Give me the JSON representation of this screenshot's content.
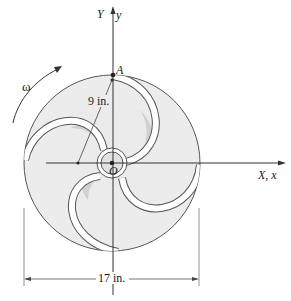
{
  "figure": {
    "type": "impeller / rotating disk with curved blades",
    "angular_velocity_label": "ω",
    "point_label": "A",
    "center_label": "O",
    "axis_y_upper": "Y",
    "axis_y_lower": "y",
    "axis_x_label": "X, x",
    "radius_dimension": "9 in.",
    "diameter_dimension": "17 in."
  },
  "colors": {
    "disk_fill": "#ececec",
    "blade_shadow": "#cfcfcf",
    "line": "#555555",
    "axis": "#333333",
    "blade_band": "#ffffff"
  }
}
